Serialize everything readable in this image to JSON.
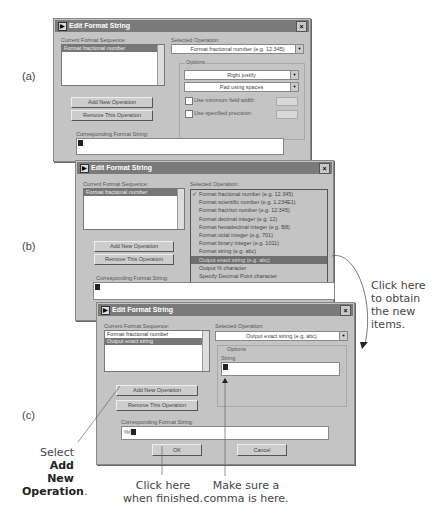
{
  "panel_labels": {
    "a": "(a)",
    "b": "(b)",
    "c": "(c)"
  },
  "dialog_a": {
    "title": "Edit Format String",
    "close": "×",
    "current_format_sequence_label": "Current Format Sequence:",
    "sequence": [
      "Format fractional number"
    ],
    "selected_operation_label": "Selected Operation:",
    "selected_operation": "Format fractional number  (e.g. 12.345)",
    "options_label": "Options",
    "justify": "Right justify",
    "padding": "Pad using spaces",
    "use_min_field_width": "Use minimum field width:",
    "use_specified_precision": "Use specified precision:",
    "add_button": "Add New Operation",
    "remove_button": "Remove This Operation",
    "corresponding_label": "Corresponding Format String:",
    "corresponding_value": ""
  },
  "dialog_b": {
    "title": "Edit Format String",
    "close": "×",
    "current_format_sequence_label": "Current Format Sequence:",
    "sequence": [
      "Format fractional number"
    ],
    "selected_operation_label": "Selected Operation:",
    "dropdown_items": [
      {
        "label": "Format fractional number  (e.g. 12.345)",
        "checked": true,
        "selected": false
      },
      {
        "label": "Format scientific number  (e.g. 1.234E1)",
        "checked": false,
        "selected": false
      },
      {
        "label": "Format fract/sci number  (e.g. 12.345)",
        "checked": false,
        "selected": false
      },
      {
        "label": "Format decimal integer  (e.g. 12)",
        "checked": false,
        "selected": false
      },
      {
        "label": "Format hexadecimal integer  (e.g. B8)",
        "checked": false,
        "selected": false
      },
      {
        "label": "Format octal integer  (e.g. 701)",
        "checked": false,
        "selected": false
      },
      {
        "label": "Format binary integer  (e.g. 1011)",
        "checked": false,
        "selected": false
      },
      {
        "label": "Format string  (e.g. abc)",
        "checked": false,
        "selected": false
      },
      {
        "label": "Output exact string  (e.g. abc)",
        "checked": false,
        "selected": true
      },
      {
        "label": "Output % character",
        "checked": false,
        "selected": false
      },
      {
        "label": "Specify Decimal Point character",
        "checked": false,
        "selected": false
      }
    ],
    "check_mark": "✓",
    "add_button": "Add New Operation",
    "remove_button": "Remove This Operation",
    "corresponding_label": "Corresponding Format String:",
    "corresponding_value": ""
  },
  "dialog_c": {
    "title": "Edit Format String",
    "close": "×",
    "current_format_sequence_label": "Current Format Sequence:",
    "sequence": [
      "Format fractional number",
      "Output exact string"
    ],
    "selected_operation_label": "Selected Operation:",
    "selected_operation": "Output exact string  (e.g. abc)",
    "options_label": "Options",
    "string_label": "String",
    "string_value": "",
    "add_button": "Add New Operation",
    "remove_button": "Remove This Operation",
    "corresponding_label": "Corresponding Format String:",
    "corresponding_value": "%f",
    "ok_button": "OK",
    "cancel_button": "Cancel"
  },
  "annotations": {
    "click_new_items": [
      "Click here",
      "to obtain",
      "the new",
      "items."
    ],
    "select_prefix": "Select",
    "select_bold_1": "Add New",
    "select_bold_2": "Operation",
    "select_suffix": ".",
    "click_finished": [
      "Click here",
      "when finished."
    ],
    "comma": [
      "Make sure a",
      "comma is here."
    ]
  }
}
